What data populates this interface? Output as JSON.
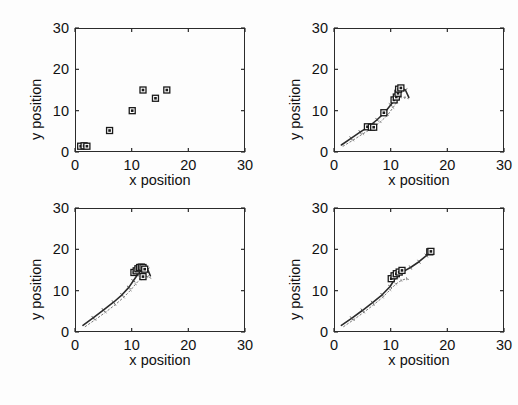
{
  "figure": {
    "layout": "2x2",
    "background": "#ffffff",
    "axis_color": "#2b2b2b",
    "marker_color": "#1a1a1a",
    "trail_color": "#555555"
  },
  "chart_data": [
    {
      "type": "scatter",
      "title": "",
      "xlabel": "x position",
      "ylabel": "y position",
      "xlim": [
        0,
        30
      ],
      "ylim": [
        0,
        30
      ],
      "xticks": [
        0,
        10,
        20,
        30
      ],
      "yticks": [
        0,
        10,
        20,
        30
      ],
      "xticklabels": [
        "0",
        "10",
        "20",
        "30"
      ],
      "yticklabels": [
        "0",
        "10",
        "20",
        "30"
      ],
      "grid": false,
      "legend": "none",
      "series": [
        {
          "name": "agent positions",
          "marker": "square",
          "x": [
            1.0,
            1.6,
            2.1,
            6.1,
            10.1,
            12.0,
            14.2,
            16.2
          ],
          "y": [
            1.4,
            1.5,
            1.4,
            5.2,
            10.0,
            15.0,
            13.0,
            15.0
          ]
        }
      ],
      "trails": []
    },
    {
      "type": "scatter",
      "title": "",
      "xlabel": "x position",
      "ylabel": "y position",
      "xlim": [
        0,
        30
      ],
      "ylim": [
        0,
        30
      ],
      "xticks": [
        0,
        10,
        20,
        30
      ],
      "yticks": [
        0,
        10,
        20,
        30
      ],
      "xticklabels": [
        "0",
        "10",
        "20",
        "30"
      ],
      "yticklabels": [
        "0",
        "10",
        "20",
        "30"
      ],
      "grid": false,
      "legend": "none",
      "series": [
        {
          "name": "agent positions",
          "marker": "square",
          "x": [
            5.9,
            6.6,
            7.0,
            8.8,
            10.6,
            11.0,
            11.3,
            11.4,
            11.8
          ],
          "y": [
            6.1,
            6.0,
            6.0,
            9.5,
            12.6,
            13.3,
            14.2,
            15.2,
            15.5
          ]
        }
      ],
      "trails": [
        {
          "name": "trajectory-main",
          "x": [
            1.3,
            3.0,
            4.6,
            6.2,
            7.6,
            8.9,
            10.0,
            10.8,
            11.4,
            12.0,
            12.6,
            13.2
          ],
          "y": [
            1.7,
            3.3,
            4.8,
            6.2,
            7.8,
            9.5,
            11.4,
            12.8,
            14.2,
            15.4,
            15.0,
            13.2
          ]
        },
        {
          "name": "trajectory-dotted",
          "x": [
            1.6,
            3.4,
            5.1,
            6.8,
            8.2,
            9.5,
            10.4,
            11.1,
            11.8,
            12.5,
            13.1
          ],
          "y": [
            1.4,
            2.9,
            4.4,
            5.8,
            7.3,
            9.0,
            10.7,
            12.1,
            13.3,
            13.2,
            12.9
          ]
        }
      ]
    },
    {
      "type": "scatter",
      "title": "",
      "xlabel": "x position",
      "ylabel": "y position",
      "xlim": [
        0,
        30
      ],
      "ylim": [
        0,
        30
      ],
      "xticks": [
        0,
        10,
        20,
        30
      ],
      "yticks": [
        0,
        10,
        20,
        30
      ],
      "xticklabels": [
        "0",
        "10",
        "20",
        "30"
      ],
      "yticklabels": [
        "0",
        "10",
        "20",
        "30"
      ],
      "grid": false,
      "legend": "none",
      "series": [
        {
          "name": "agent positions",
          "marker": "square",
          "x": [
            10.4,
            10.8,
            11.1,
            11.4,
            11.7,
            12.0,
            12.3,
            12.0
          ],
          "y": [
            14.4,
            14.8,
            15.3,
            15.6,
            15.7,
            15.6,
            15.2,
            13.4
          ]
        }
      ],
      "trails": [
        {
          "name": "trajectory-main",
          "x": [
            1.4,
            3.2,
            5.0,
            6.8,
            8.3,
            9.5,
            10.3,
            11.0,
            11.6,
            12.2,
            12.8,
            13.3
          ],
          "y": [
            1.6,
            3.4,
            5.3,
            7.2,
            9.0,
            10.8,
            12.4,
            13.8,
            15.0,
            15.8,
            15.2,
            13.6
          ]
        },
        {
          "name": "trajectory-dotted",
          "x": [
            1.8,
            3.6,
            5.4,
            7.1,
            8.6,
            9.8,
            10.7,
            11.5,
            12.2,
            12.9,
            13.4
          ],
          "y": [
            1.3,
            3.0,
            4.8,
            6.6,
            8.4,
            10.1,
            11.6,
            12.8,
            13.6,
            13.4,
            13.0
          ]
        }
      ]
    },
    {
      "type": "scatter",
      "title": "",
      "xlabel": "x position",
      "ylabel": "y position",
      "xlim": [
        0,
        30
      ],
      "ylim": [
        0,
        30
      ],
      "xticks": [
        0,
        10,
        20,
        30
      ],
      "yticks": [
        0,
        10,
        20,
        30
      ],
      "xticklabels": [
        "0",
        "10",
        "20",
        "30"
      ],
      "yticklabels": [
        "0",
        "10",
        "20",
        "30"
      ],
      "grid": false,
      "legend": "none",
      "series": [
        {
          "name": "agent positions",
          "marker": "square",
          "x": [
            10.1,
            10.6,
            11.0,
            11.5,
            12.0,
            16.9,
            17.1
          ],
          "y": [
            12.9,
            13.6,
            14.1,
            14.5,
            14.9,
            19.4,
            19.5
          ]
        }
      ],
      "trails": [
        {
          "name": "trajectory-main",
          "x": [
            1.3,
            3.1,
            5.0,
            6.8,
            8.5,
            9.9,
            11.0,
            12.2,
            13.5,
            15.0,
            16.3,
            17.1
          ],
          "y": [
            1.6,
            3.3,
            5.2,
            7.1,
            9.0,
            11.0,
            13.4,
            14.6,
            15.6,
            17.0,
            18.5,
            19.4
          ]
        },
        {
          "name": "trajectory-dotted",
          "x": [
            1.7,
            3.5,
            5.3,
            7.0,
            8.6,
            9.9,
            10.9,
            11.9,
            12.8,
            13.4
          ],
          "y": [
            1.3,
            3.0,
            4.8,
            6.6,
            8.4,
            10.2,
            11.6,
            12.5,
            12.9,
            12.6
          ]
        }
      ]
    }
  ]
}
